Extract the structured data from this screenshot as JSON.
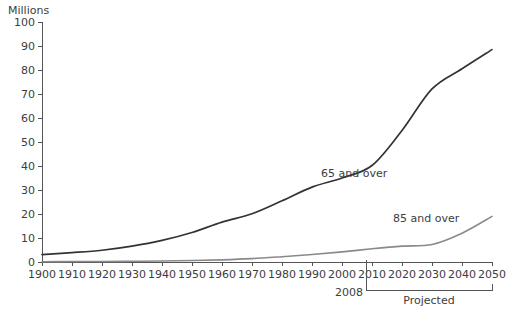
{
  "chart_data": {
    "type": "line",
    "title": "",
    "xlabel": "",
    "ylabel": "Millions",
    "ylim": [
      0,
      100
    ],
    "xlim": [
      1900,
      2050
    ],
    "grid": false,
    "legend_position": "inline-labels",
    "y_ticks": [
      0,
      10,
      20,
      30,
      40,
      50,
      60,
      70,
      80,
      90,
      100
    ],
    "x_ticks": [
      1900,
      1910,
      1920,
      1930,
      1940,
      1950,
      1960,
      1970,
      1980,
      1990,
      2000,
      2010,
      2020,
      2030,
      2040,
      2050
    ],
    "x": [
      1900,
      1910,
      1920,
      1930,
      1940,
      1950,
      1960,
      1970,
      1980,
      1990,
      2000,
      2010,
      2020,
      2030,
      2040,
      2050
    ],
    "series": [
      {
        "name": "65 and over",
        "label": "65 and over",
        "color": "#333333",
        "width": 1.7,
        "values": [
          3.1,
          3.9,
          4.9,
          6.6,
          9.0,
          12.3,
          16.6,
          20.1,
          25.5,
          31.2,
          35.0,
          40.2,
          54.8,
          72.1,
          80.5,
          88.5
        ],
        "label_x": 1993,
        "label_y": 35.5
      },
      {
        "name": "85 and over",
        "label": "85 and over",
        "color": "#8a8a8a",
        "width": 1.6,
        "values": [
          0.1,
          0.2,
          0.2,
          0.3,
          0.4,
          0.6,
          0.9,
          1.4,
          2.2,
          3.1,
          4.2,
          5.5,
          6.6,
          7.3,
          12.0,
          19.0
        ],
        "label_x": 2017,
        "label_y": 16.5
      }
    ],
    "annotations": [
      {
        "name": "projection-start-marker",
        "label": "2008",
        "x": 2008,
        "type": "vertical-tick"
      },
      {
        "name": "projected-bracket",
        "label": "Projected",
        "x_start": 2008,
        "x_end": 2050,
        "type": "bracket"
      }
    ]
  }
}
